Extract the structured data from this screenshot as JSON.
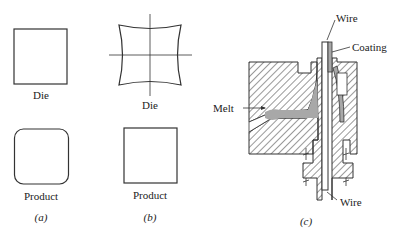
{
  "panels": [
    {
      "id": "a",
      "caption": "(a)",
      "die_label": "Die",
      "product_label": "Product",
      "die_shape": "square",
      "product_shape": "rounded-square"
    },
    {
      "id": "b",
      "caption": "(b)",
      "die_label": "Die",
      "product_label": "Product",
      "die_shape": "concave-sided square with crosshair",
      "product_shape": "square"
    },
    {
      "id": "c",
      "caption": "(c)",
      "labels": {
        "wire_top": "Wire",
        "coating": "Coating",
        "melt": "Melt",
        "wire_bottom": "Wire"
      },
      "description": "Cross-section of wire-coating extrusion die"
    }
  ],
  "colors": {
    "line": "#333333",
    "melt_fill": "#a8a8a8",
    "background": "#ffffff"
  }
}
